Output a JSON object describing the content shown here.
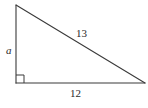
{
  "diagram": {
    "type": "right-triangle",
    "vertices": {
      "top": [
        16,
        5
      ],
      "right_angle": [
        16,
        83
      ],
      "bottom_right": [
        145,
        83
      ]
    },
    "right_angle_marker_size": 8,
    "labels": {
      "vertical_leg": "a",
      "hypotenuse": "13",
      "base": "12"
    },
    "colors": {
      "line": "#3a3a3a",
      "text": "#2a2a2a",
      "background": "#ffffff"
    }
  }
}
